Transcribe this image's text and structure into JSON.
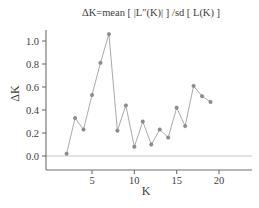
{
  "chart_data": {
    "type": "line",
    "title": "ΔK=mean [ |L″(K)| ] /sd [ L(K) ]",
    "xlabel": "K",
    "ylabel": "ΔK",
    "x": [
      2,
      3,
      4,
      5,
      6,
      7,
      8,
      9,
      10,
      11,
      12,
      13,
      14,
      15,
      16,
      17,
      18,
      19
    ],
    "values": [
      0.02,
      0.33,
      0.23,
      0.53,
      0.81,
      1.06,
      0.22,
      0.44,
      0.08,
      0.3,
      0.1,
      0.23,
      0.16,
      0.42,
      0.26,
      0.61,
      0.52,
      0.47
    ],
    "series": [
      {
        "name": "ΔK",
        "values": [
          0.02,
          0.33,
          0.23,
          0.53,
          0.81,
          1.06,
          0.22,
          0.44,
          0.08,
          0.3,
          0.1,
          0.23,
          0.16,
          0.42,
          0.26,
          0.61,
          0.52,
          0.47
        ]
      }
    ],
    "xlim": [
      1,
      20.5
    ],
    "ylim": [
      -0.05,
      1.12
    ],
    "xticks": [
      5,
      10,
      15,
      20
    ],
    "xticklabels": [
      "5",
      "10",
      "15",
      "20"
    ],
    "yticks": [
      0.0,
      0.2,
      0.4,
      0.6,
      0.8,
      1.0
    ],
    "yticklabels": [
      "0.0",
      "0.2",
      "0.4",
      "0.6",
      "0.8",
      "1.0"
    ],
    "grid": false,
    "legend": null,
    "marker": "circle",
    "line_color": "#9a9a9a",
    "marker_color": "#8f8f8f",
    "zero_line_color": "#d8d8d8",
    "axis_color": "#6e6e6e"
  },
  "figure": {
    "background": "#ffffff",
    "title_text": "ΔK=mean [ |L″(K)| ] /sd [ L(K) ]",
    "y_axis_label": "ΔK",
    "x_axis_label": "K"
  }
}
